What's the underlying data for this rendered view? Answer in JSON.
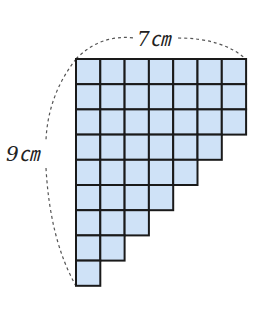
{
  "diagram": {
    "type": "staircase-grid",
    "labels": {
      "width": "7㎝",
      "height": "9㎝"
    },
    "grid": {
      "columns": 7,
      "rows": 9,
      "row_lengths": [
        7,
        7,
        7,
        6,
        5,
        4,
        3,
        2,
        1
      ],
      "origin": [
        76,
        59
      ],
      "cell_w": 24.3,
      "cell_h": 25.2
    },
    "colors": {
      "fill": "#cfe2f7",
      "stroke": "#1a1a1a",
      "dash": "#555555"
    }
  }
}
